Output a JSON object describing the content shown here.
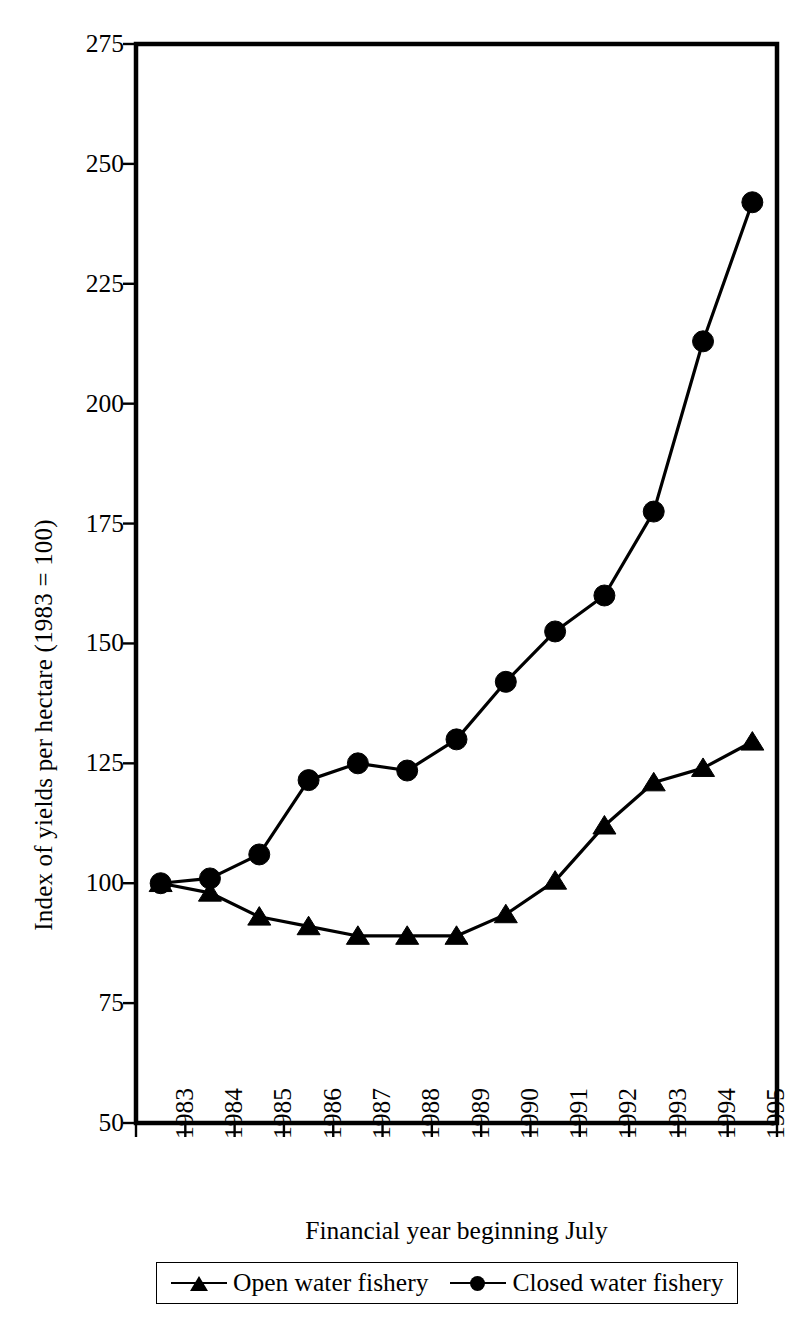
{
  "chart_data": {
    "type": "line",
    "title": "",
    "xlabel": "Financial year beginning July",
    "ylabel": "Index of yields per hectare (1983 = 100)",
    "categories": [
      "1983",
      "1984",
      "1985",
      "1986",
      "1987",
      "1988",
      "1989",
      "1990",
      "1991",
      "1992",
      "1993",
      "1994",
      "1995"
    ],
    "ylim": [
      50,
      275
    ],
    "yticks": [
      275,
      250,
      225,
      200,
      175,
      150,
      125,
      100,
      75,
      50
    ],
    "grid": false,
    "legend_position": "below-plot",
    "series": [
      {
        "name": "Open water fishery",
        "marker": "triangle",
        "color": "#000000",
        "values": [
          100,
          98,
          93,
          91,
          89,
          89,
          89,
          93.5,
          100.5,
          112,
          121,
          124,
          129.5
        ]
      },
      {
        "name": "Closed water fishery",
        "marker": "circle",
        "color": "#000000",
        "values": [
          100,
          101,
          106,
          121.5,
          125,
          123.5,
          130,
          142,
          152.5,
          160,
          177.5,
          213,
          242
        ]
      }
    ]
  },
  "legend": {
    "entries": [
      {
        "label": "Open water fishery",
        "marker": "triangle"
      },
      {
        "label": "Closed water fishery",
        "marker": "circle"
      }
    ]
  },
  "axes": {
    "y_title": "Index of yields per hectare (1983 = 100)",
    "x_title": "Financial year beginning July",
    "y_tick_labels": [
      "275",
      "250",
      "225",
      "200",
      "175",
      "150",
      "125",
      "100",
      "75",
      "50"
    ],
    "x_tick_labels": [
      "1983",
      "1984",
      "1985",
      "1986",
      "1987",
      "1988",
      "1989",
      "1990",
      "1991",
      "1992",
      "1993",
      "1994",
      "1995"
    ]
  },
  "colors": {
    "ink": "#000000",
    "background": "#ffffff"
  }
}
